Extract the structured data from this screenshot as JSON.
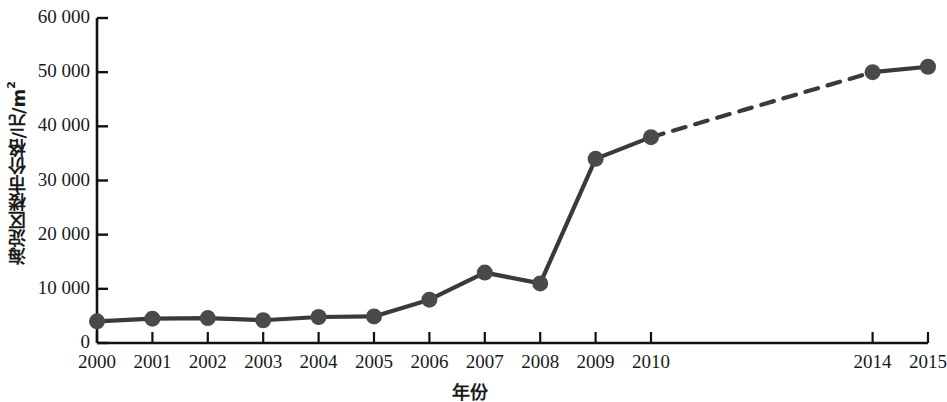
{
  "chart_data": {
    "type": "line",
    "title": "",
    "xlabel": "年份",
    "ylabel": "海淀区楼市价格/元/m²",
    "ylabel_main": "海淀区楼市价格/元/m",
    "ylabel_sup": "2",
    "categories": [
      "2000",
      "2001",
      "2002",
      "2003",
      "2004",
      "2005",
      "2006",
      "2007",
      "2008",
      "2009",
      "2010",
      "2014",
      "2015"
    ],
    "values": [
      4000,
      4500,
      4600,
      4200,
      4800,
      4900,
      8000,
      13000,
      11000,
      34000,
      38000,
      50000,
      51000
    ],
    "x_tick_labels": [
      "2000",
      "2001",
      "2002",
      "2003",
      "2004",
      "2005",
      "2006",
      "2007",
      "2008",
      "2009",
      "2010",
      "2014",
      "2015"
    ],
    "y_tick_labels": [
      "0",
      "10 000",
      "20 000",
      "30 000",
      "40 000",
      "50 000",
      "60 000"
    ],
    "y_tick_values": [
      0,
      10000,
      20000,
      30000,
      40000,
      50000,
      60000
    ],
    "ylim": [
      0,
      60000
    ],
    "xlim": [
      2000,
      2015
    ],
    "grid": false,
    "legend": "none",
    "series_color": "#3a3a3a",
    "marker_color": "#4a4a4a",
    "axis_color": "#111111",
    "dashed_segment": {
      "from": "2010",
      "to": "2014",
      "note": "projected / interpolated"
    },
    "solid_segments": [
      {
        "from": "2000",
        "to": "2010"
      },
      {
        "from": "2014",
        "to": "2015"
      }
    ]
  }
}
